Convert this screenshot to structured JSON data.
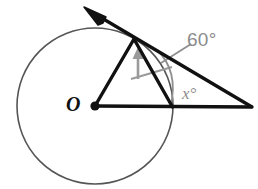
{
  "figure": {
    "type": "circle-tangent-geometry-diagram",
    "background_color": "#ffffff",
    "stroke_color_primary": "#111111",
    "stroke_color_circle": "#555555",
    "stroke_color_annotation": "#8c8c8c"
  },
  "labels": {
    "center_label": "O",
    "angle_sixty": "60°",
    "angle_x": "x°"
  },
  "geometry": {
    "circle": {
      "cx": 95,
      "cy": 106,
      "r": 78
    },
    "center_point": {
      "cx": 95,
      "cy": 106,
      "r": 4.5
    },
    "tangent_point": {
      "x": 134,
      "y": 39
    },
    "external_point": {
      "x": 252,
      "y": 107
    },
    "chord_endpoint": {
      "x": 172,
      "y": 106
    },
    "tangent_ray_tip": {
      "x": 85,
      "y": 8
    },
    "radius_line": "M 95 106 L 134 39",
    "horizontal_line": "M 95 106 L 252 107",
    "chord_line": "M 134 39 L 172 106",
    "tangent_line": "M 92 13 L 252 107",
    "arrow_head": "M 85 8 L 102 18 L 98 23 Z",
    "angle_arc": "M 158 51 Q 178 72 171 106",
    "leader_line": "M 163 62 L 190 45",
    "tick_arrow_shaft": "M 138 78 L 138 53",
    "tick_arrow_head": "M 138 48 L 133 59 L 143 59 Z",
    "tick_arrow_base": "M 131 79 L 172 67"
  }
}
